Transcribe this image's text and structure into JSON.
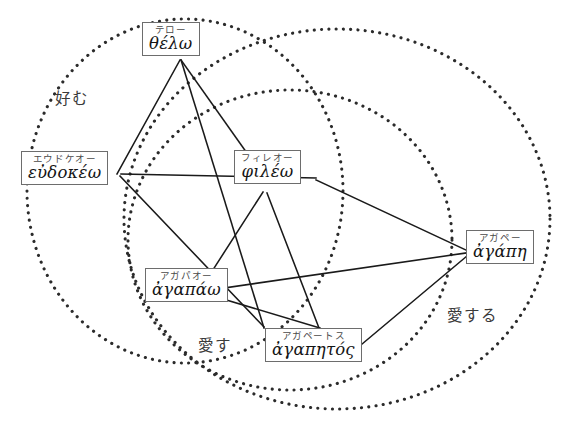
{
  "diagram": {
    "width": 562,
    "height": 433,
    "background_color": "#ffffff",
    "stroke_color": "#1a1a1a",
    "dotted_color": "#2b2b2b"
  },
  "nodes": [
    {
      "id": "thelo",
      "kana": "テロー",
      "greek": "θέλω",
      "x": 142,
      "y": 22,
      "cx": 181,
      "cy": 60
    },
    {
      "id": "eudokeo",
      "kana": "エウドケオー",
      "greek": "εὐδοκέω",
      "x": 21,
      "y": 151,
      "cx": 117,
      "cy": 189
    },
    {
      "id": "phileo",
      "kana": "フィレオー",
      "greek": "φιλέω",
      "x": 234,
      "y": 150,
      "cx": 277,
      "cy": 188
    },
    {
      "id": "agapao",
      "kana": "アガパオー",
      "greek": "ἀγαπάω",
      "x": 145,
      "y": 268,
      "cx": 194,
      "cy": 306
    },
    {
      "id": "agapetos",
      "kana": "アガペートス",
      "greek": "ἀγαπητός",
      "x": 265,
      "y": 328,
      "cx": 316,
      "cy": 366
    },
    {
      "id": "agape",
      "kana": "アガペー",
      "greek": "ἀγάπη",
      "x": 466,
      "y": 230,
      "cx": 505,
      "cy": 268
    }
  ],
  "edges": [
    {
      "from": "thelo",
      "to": "eudokeo",
      "x1": 180,
      "y1": 60,
      "x2": 117,
      "y2": 174
    },
    {
      "from": "thelo",
      "to": "phileo",
      "x1": 181,
      "y1": 60,
      "x2": 261,
      "y2": 173
    },
    {
      "from": "thelo",
      "to": "agapetos",
      "x1": 181,
      "y1": 60,
      "x2": 264,
      "y2": 328
    },
    {
      "from": "eudokeo",
      "to": "phileo",
      "x1": 121,
      "y1": 174,
      "x2": 316,
      "y2": 178
    },
    {
      "from": "eudokeo",
      "to": "agapao",
      "x1": 120,
      "y1": 176,
      "x2": 264,
      "y2": 327
    },
    {
      "from": "phileo",
      "to": "agapao",
      "x1": 263,
      "y1": 192,
      "x2": 200,
      "y2": 290
    },
    {
      "from": "phileo",
      "to": "agapetos",
      "x1": 267,
      "y1": 193,
      "x2": 319,
      "y2": 328
    },
    {
      "from": "phileo",
      "to": "agape",
      "x1": 316,
      "y1": 180,
      "x2": 466,
      "y2": 250
    },
    {
      "from": "agapao",
      "to": "agape",
      "x1": 203,
      "y1": 291,
      "x2": 466,
      "y2": 253
    },
    {
      "from": "agapao",
      "to": "agapetos",
      "x1": 203,
      "y1": 293,
      "x2": 320,
      "y2": 328
    },
    {
      "from": "agapetos",
      "to": "agape",
      "x1": 343,
      "y1": 360,
      "x2": 467,
      "y2": 256
    }
  ],
  "regions": [
    {
      "id": "konomu",
      "label": "好む",
      "label_x": 55,
      "label_y": 86,
      "cx": 185,
      "cy": 191,
      "rx": 158,
      "ry": 172,
      "rotate": 0
    },
    {
      "id": "aisu",
      "label": "愛す",
      "label_x": 198,
      "label_y": 333,
      "cx": 290,
      "cy": 240,
      "rx": 162,
      "ry": 150,
      "rotate": 0
    },
    {
      "id": "aisuru",
      "label": "愛する",
      "label_x": 447,
      "label_y": 303,
      "cx": 337,
      "cy": 219,
      "rx": 213,
      "ry": 190,
      "rotate": 0
    }
  ]
}
